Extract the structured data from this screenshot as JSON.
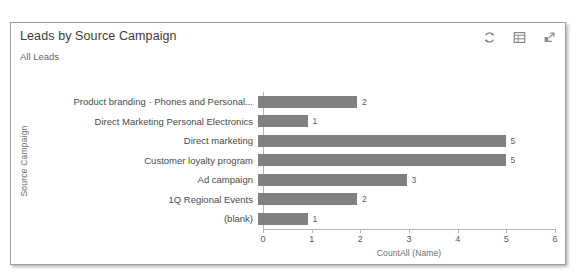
{
  "card": {
    "title": "Leads by Source Campaign",
    "subtitle": "All Leads",
    "actions": [
      {
        "name": "refresh-icon",
        "label": "Refresh"
      },
      {
        "name": "show-as-table-icon",
        "label": "Show As Table"
      },
      {
        "name": "pop-out-icon",
        "label": "Pop Out Chart"
      }
    ]
  },
  "colors": {
    "bar": "#808080",
    "axis": "#b4b4b4",
    "title_text": "#3b3b3b",
    "label_text": "#4a4a4a",
    "border": "#9e9e9e"
  },
  "chart_data": {
    "type": "bar",
    "orientation": "horizontal",
    "title": "Leads by Source Campaign",
    "subtitle": "All Leads",
    "xlabel": "CountAll (Name)",
    "ylabel": "Source Campaign",
    "xlim": [
      0,
      6
    ],
    "xticks": [
      0,
      1,
      2,
      3,
      4,
      5,
      6
    ],
    "xtick_labels": [
      "0",
      "1",
      "2",
      "3",
      "4",
      "5",
      "6"
    ],
    "grid": false,
    "legend": false,
    "categories": [
      "Product branding · Phones and Personal...",
      "Direct Marketing Personal Electronics",
      "Direct marketing",
      "Customer loyalty program",
      "Ad campaign",
      "1Q Regional Events",
      "(blank)"
    ],
    "values": [
      2,
      1,
      5,
      5,
      3,
      2,
      1
    ],
    "value_labels": [
      "2",
      "1",
      "5",
      "5",
      "3",
      "2",
      "1"
    ]
  }
}
